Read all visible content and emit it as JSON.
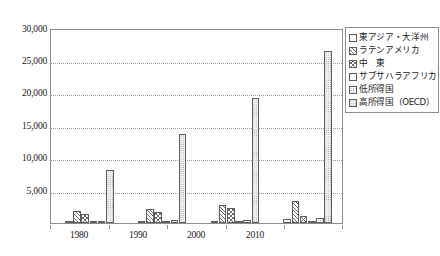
{
  "chart_data": {
    "type": "bar",
    "title": "",
    "xlabel": "",
    "ylabel": "",
    "ylim": [
      0,
      30000
    ],
    "ytick_labels": [
      "30,000",
      "25,000",
      "20,000",
      "15,000",
      "10,000",
      "5,000"
    ],
    "ytick_values": [
      30000,
      25000,
      20000,
      15000,
      10000,
      5000
    ],
    "grid": true,
    "legend_position": "right",
    "categories": [
      "1980",
      "1990",
      "2000",
      "",
      "2010",
      ""
    ],
    "xtick_labels": [
      "1980",
      "1990",
      "2000",
      "2010"
    ],
    "series": [
      {
        "name": "東アジア・大洋州",
        "pattern": "blank",
        "values": [
          120,
          140,
          200,
          260,
          420,
          700
        ]
      },
      {
        "name": "ラテンアメリカ",
        "pattern": "diagonal-hatch",
        "values": [
          1900,
          2200,
          2700,
          2600,
          3400,
          3100
        ]
      },
      {
        "name": "中　東",
        "pattern": "cross-hatch",
        "values": [
          1350,
          1700,
          2400,
          1900,
          1100,
          1000
        ]
      },
      {
        "name": "サブサハラアフリカ",
        "pattern": "blank",
        "values": [
          90,
          110,
          150,
          170,
          230,
          260
        ]
      },
      {
        "name": "低所得国",
        "pattern": "coarse-dots",
        "values": [
          330,
          380,
          480,
          560,
          700,
          1150
        ]
      },
      {
        "name": "高所得国（OECD）",
        "pattern": "fine-dots",
        "values": [
          8300,
          13900,
          19500,
          26800,
          19400,
          26800
        ]
      }
    ],
    "clusters": [
      {
        "label": "1980",
        "bars": [
          {
            "series": "東アジア・大洋州",
            "value": 120,
            "pattern": "blank"
          },
          {
            "series": "ラテンアメリカ",
            "value": 1900,
            "pattern": "diagonal-hatch"
          },
          {
            "series": "中　東",
            "value": 1350,
            "pattern": "cross-hatch"
          },
          {
            "series": "サブサハラアフリカ",
            "value": 90,
            "pattern": "blank"
          },
          {
            "series": "低所得国",
            "value": 330,
            "pattern": "coarse-dots"
          },
          {
            "series": "高所得国（OECD）",
            "value": 8300,
            "pattern": "fine-dots"
          }
        ]
      },
      {
        "label": "1990",
        "bars": [
          {
            "series": "東アジア・大洋州",
            "value": 160,
            "pattern": "blank"
          },
          {
            "series": "ラテンアメリカ",
            "value": 2200,
            "pattern": "diagonal-hatch"
          },
          {
            "series": "中　東",
            "value": 1750,
            "pattern": "cross-hatch"
          },
          {
            "series": "サブサハラアフリカ",
            "value": 110,
            "pattern": "blank"
          },
          {
            "series": "低所得国",
            "value": 400,
            "pattern": "coarse-dots"
          },
          {
            "series": "高所得国（OECD）",
            "value": 13900,
            "pattern": "fine-dots"
          }
        ]
      },
      {
        "label": "2000",
        "bars": [
          {
            "series": "東アジア・大洋州",
            "value": 250,
            "pattern": "blank"
          },
          {
            "series": "ラテンアメリカ",
            "value": 2750,
            "pattern": "diagonal-hatch"
          },
          {
            "series": "中　東",
            "value": 2350,
            "pattern": "cross-hatch"
          },
          {
            "series": "サブサハラアフリカ",
            "value": 150,
            "pattern": "blank"
          },
          {
            "series": "低所得国",
            "value": 500,
            "pattern": "coarse-dots"
          },
          {
            "series": "高所得国（OECD）",
            "value": 19500,
            "pattern": "fine-dots"
          }
        ]
      },
      {
        "label": "2010",
        "bars": [
          {
            "series": "東アジア・大洋州",
            "value": 620,
            "pattern": "blank"
          },
          {
            "series": "ラテンアメリカ",
            "value": 3450,
            "pattern": "diagonal-hatch"
          },
          {
            "series": "中　東",
            "value": 1150,
            "pattern": "cross-hatch"
          },
          {
            "series": "サブサハラアフリカ",
            "value": 240,
            "pattern": "blank"
          },
          {
            "series": "低所得国",
            "value": 760,
            "pattern": "coarse-dots"
          },
          {
            "series": "高所得国（OECD）",
            "value": 26800,
            "pattern": "fine-dots"
          }
        ]
      }
    ]
  },
  "legend": {
    "items": [
      {
        "label": "東アジア・大洋州",
        "pattern": "blank"
      },
      {
        "label": "ラテンアメリカ",
        "pattern": "diagonal-hatch"
      },
      {
        "label": "中　東",
        "pattern": "cross-hatch"
      },
      {
        "label": "サブサハラアフリカ",
        "pattern": "blank"
      },
      {
        "label": "低所得国",
        "pattern": "coarse-dots"
      },
      {
        "label": "高所得国（OECD）",
        "pattern": "fine-dots"
      }
    ]
  }
}
